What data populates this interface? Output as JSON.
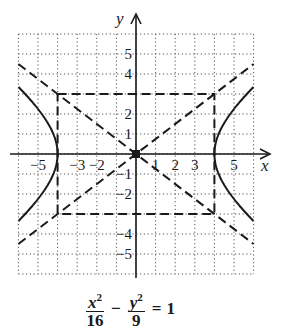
{
  "chart_data": {
    "type": "line",
    "xlabel": "x",
    "ylabel": "y",
    "xlim": [
      -6,
      6
    ],
    "ylim": [
      -6,
      6
    ],
    "grid": true,
    "x_tick_labels": [
      "-5",
      "-3",
      "-2",
      "1",
      "2",
      "3",
      "5"
    ],
    "y_tick_labels": [
      "5",
      "4",
      "2",
      "1",
      "-1",
      "-2",
      "-4",
      "-5"
    ],
    "series": [
      {
        "name": "hyperbola right branch",
        "style": "solid",
        "x": [
          6,
          5,
          4.5,
          4.2,
          4,
          4.2,
          4.5,
          5,
          6
        ],
        "y": [
          3.35,
          2.25,
          1.55,
          0.96,
          0,
          -0.96,
          -1.55,
          -2.25,
          -3.35
        ]
      },
      {
        "name": "hyperbola left branch",
        "style": "solid",
        "x": [
          -6,
          -5,
          -4.5,
          -4.2,
          -4,
          -4.2,
          -4.5,
          -5,
          -6
        ],
        "y": [
          3.35,
          2.25,
          1.55,
          0.96,
          0,
          -0.96,
          -1.55,
          -2.25,
          -3.35
        ]
      },
      {
        "name": "asymptote y = 3x/4",
        "style": "dashed",
        "x": [
          -6,
          6
        ],
        "y": [
          -4.5,
          4.5
        ]
      },
      {
        "name": "asymptote y = -3x/4",
        "style": "dashed",
        "x": [
          -6,
          6
        ],
        "y": [
          4.5,
          -4.5
        ]
      },
      {
        "name": "fundamental rectangle",
        "style": "dashed",
        "x": [
          -4,
          4,
          4,
          -4,
          -4
        ],
        "y": [
          3,
          3,
          -3,
          -3,
          3
        ]
      }
    ],
    "annotations": [
      "x^2/16 - y^2/9 = 1"
    ]
  },
  "labels": {
    "x_axis": "x",
    "y_axis": "y",
    "x_ticks": [
      {
        "v": -5,
        "t": "−5"
      },
      {
        "v": -3,
        "t": "−3"
      },
      {
        "v": -2,
        "t": "−2"
      },
      {
        "v": 1,
        "t": "1"
      },
      {
        "v": 2,
        "t": "2"
      },
      {
        "v": 3,
        "t": "3"
      },
      {
        "v": 5,
        "t": "5"
      }
    ],
    "y_ticks": [
      {
        "v": 5,
        "t": "5"
      },
      {
        "v": 4,
        "t": "4"
      },
      {
        "v": 2,
        "t": "2"
      },
      {
        "v": 1,
        "t": "1"
      },
      {
        "v": -1,
        "t": "−1"
      },
      {
        "v": -2,
        "t": "−2"
      },
      {
        "v": -4,
        "t": "−4"
      },
      {
        "v": -5,
        "t": "−5"
      }
    ]
  },
  "equation": {
    "num1": "x",
    "exp1": "2",
    "den1": "16",
    "minus": "−",
    "num2": "y",
    "exp2": "2",
    "den2": "9",
    "equals": "=",
    "rhs": "1"
  }
}
